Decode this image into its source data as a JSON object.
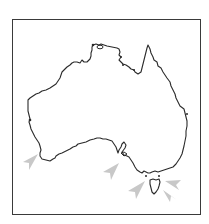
{
  "map": {
    "title": "",
    "region": "Australia",
    "style": {
      "frame_color": "#3a3a3a",
      "coast_color": "#2a2a2a",
      "arrow_color": "#c8c8c8",
      "background": "#ffffff"
    },
    "markers": [
      {
        "name": "arrow-southwest-wa",
        "x": 27,
        "y": 163,
        "direction": "northeast"
      },
      {
        "name": "arrow-south-australia",
        "x": 108,
        "y": 172,
        "direction": "northeast"
      },
      {
        "name": "arrow-bass-strait-west",
        "x": 133,
        "y": 191,
        "direction": "northeast"
      },
      {
        "name": "arrow-bass-strait-east",
        "x": 180,
        "y": 183,
        "direction": "west"
      },
      {
        "name": "arrow-tasman-southeast",
        "x": 172,
        "y": 201,
        "direction": "northwest"
      }
    ]
  }
}
